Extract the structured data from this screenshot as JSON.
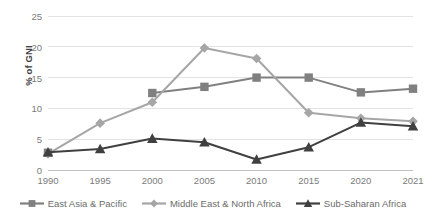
{
  "chart_data": {
    "type": "line",
    "title": "",
    "xlabel": "",
    "ylabel": "% of GNI",
    "categories": [
      "1990",
      "1995",
      "2000",
      "2005",
      "2010",
      "2015",
      "2020",
      "2021"
    ],
    "ylim": [
      0,
      25
    ],
    "ytick_labels": [
      "0",
      "5",
      "10",
      "15",
      "20",
      "25"
    ],
    "ytick_values": [
      0,
      5,
      10,
      15,
      20,
      25
    ],
    "grid": "horizontal",
    "legend_position": "bottom",
    "series": [
      {
        "name": "East Asia & Pacific",
        "color": "#808080",
        "marker": "square",
        "values": [
          2.8,
          null,
          12.5,
          13.5,
          15.0,
          15.0,
          12.6,
          13.2
        ]
      },
      {
        "name": "Middle East & North Africa",
        "color": "#a6a6a6",
        "marker": "diamond",
        "values": [
          2.6,
          7.6,
          11.0,
          19.8,
          18.1,
          9.3,
          8.4,
          7.9
        ]
      },
      {
        "name": "Sub-Saharan Africa",
        "color": "#404040",
        "marker": "triangle",
        "values": [
          2.9,
          3.4,
          5.1,
          4.5,
          1.7,
          3.7,
          7.7,
          7.1
        ]
      }
    ]
  }
}
